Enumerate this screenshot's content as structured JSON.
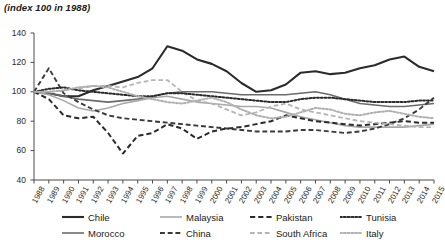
{
  "chart_data": {
    "type": "line",
    "title": "(index 100 in 1988)",
    "xlabel": "",
    "ylabel": "",
    "ylim": [
      40,
      140
    ],
    "yticks": [
      40,
      60,
      80,
      100,
      120,
      140
    ],
    "grid": false,
    "legend_position": "bottom",
    "x": [
      1988,
      1989,
      1990,
      1991,
      1992,
      1993,
      1994,
      1995,
      1996,
      1997,
      1998,
      1999,
      2000,
      2001,
      2002,
      2003,
      2004,
      2005,
      2006,
      2007,
      2008,
      2009,
      2010,
      2011,
      2012,
      2013,
      2014,
      2015
    ],
    "series": [
      {
        "name": "Chile",
        "color": "#2b2b2b",
        "style": "solid",
        "width": 2.1,
        "values": [
          100,
          99,
          97,
          97,
          101,
          104,
          107,
          110,
          116,
          131,
          128,
          122,
          119,
          114,
          106,
          100,
          101,
          105,
          113,
          114,
          112,
          113,
          116,
          118,
          122,
          124,
          117,
          114
        ]
      },
      {
        "name": "Morocco",
        "color": "#6b6b6b",
        "style": "solid",
        "width": 1.6,
        "values": [
          100,
          99,
          97,
          95,
          94,
          93,
          94,
          95,
          97,
          99,
          100,
          100,
          100,
          99,
          98,
          98,
          98,
          98,
          99,
          100,
          98,
          95,
          92,
          91,
          90,
          90,
          91,
          92
        ]
      },
      {
        "name": "Malaysia",
        "color": "#a8a8a8",
        "style": "solid",
        "width": 1.6,
        "values": [
          100,
          98,
          94,
          89,
          87,
          89,
          92,
          94,
          96,
          97,
          95,
          93,
          92,
          91,
          90,
          90,
          89,
          86,
          83,
          81,
          79,
          77,
          76,
          76,
          76,
          76,
          77,
          78
        ]
      },
      {
        "name": "China",
        "color": "#3a3a3a",
        "style": "dashed",
        "width": 1.9,
        "values": [
          100,
          116,
          99,
          93,
          88,
          84,
          82,
          81,
          80,
          79,
          78,
          77,
          76,
          75,
          74,
          73,
          73,
          73,
          74,
          74,
          73,
          72,
          73,
          75,
          78,
          82,
          88,
          96
        ]
      },
      {
        "name": "Pakistan",
        "color": "#2b2b2b",
        "style": "dashed",
        "width": 2.0,
        "values": [
          100,
          95,
          84,
          82,
          83,
          72,
          58,
          70,
          72,
          78,
          75,
          68,
          73,
          75,
          76,
          78,
          80,
          84,
          82,
          80,
          79,
          78,
          77,
          78,
          79,
          80,
          79,
          79
        ]
      },
      {
        "name": "South Africa",
        "color": "#b5b5b5",
        "style": "dashed",
        "width": 1.8,
        "values": [
          100,
          100,
          101,
          102,
          104,
          104,
          103,
          106,
          108,
          108,
          100,
          94,
          92,
          88,
          84,
          86,
          90,
          92,
          88,
          86,
          84,
          82,
          80,
          79,
          78,
          77,
          76,
          76
        ]
      },
      {
        "name": "Tunisia",
        "color": "#2b2b2b",
        "style": "dotted",
        "width": 2.0,
        "values": [
          100,
          102,
          103,
          101,
          100,
          99,
          98,
          97,
          97,
          99,
          99,
          98,
          97,
          96,
          95,
          94,
          93,
          93,
          95,
          96,
          96,
          95,
          94,
          93,
          93,
          93,
          94,
          94
        ]
      },
      {
        "name": "Italy",
        "color": "#b0b0b0",
        "style": "dotted",
        "width": 2.0,
        "values": [
          100,
          100,
          101,
          103,
          104,
          103,
          100,
          97,
          95,
          93,
          92,
          94,
          96,
          93,
          88,
          84,
          82,
          83,
          86,
          89,
          88,
          85,
          84,
          86,
          87,
          85,
          83,
          82
        ]
      }
    ]
  },
  "legend": {
    "row1": [
      {
        "label": "Chile"
      },
      {
        "label": "Malaysia"
      },
      {
        "label": "Pakistan"
      },
      {
        "label": "Tunisia"
      }
    ],
    "row2": [
      {
        "label": "Morocco"
      },
      {
        "label": "China"
      },
      {
        "label": "South Africa"
      },
      {
        "label": "Italy"
      }
    ]
  }
}
